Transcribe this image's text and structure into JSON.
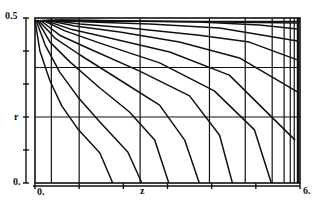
{
  "chart_data": {
    "type": "line",
    "title": "",
    "xlabel": "z",
    "ylabel": "r",
    "xlim": [
      0,
      6
    ],
    "ylim": [
      0,
      0.5
    ],
    "x_tick_labels": [
      "0.",
      "6."
    ],
    "y_tick_labels": [
      "0.",
      "0.5"
    ],
    "x_ticks": [
      0,
      1,
      2,
      3,
      4,
      5,
      6
    ],
    "y_ticks": [
      0,
      0.1,
      0.2,
      0.3,
      0.4,
      0.5
    ],
    "grid": true,
    "grid_z": [
      0.37,
      1.0,
      2.38,
      3.95,
      4.76,
      5.37,
      5.64,
      5.78,
      5.87
    ],
    "grid_r": [
      0.35,
      0.2,
      0.49
    ],
    "line_color": "#111111",
    "background": "#ffffff",
    "series": [
      {
        "name": "contour-1",
        "z": [
          0.0,
          0.11,
          0.34,
          0.61,
          0.97,
          1.47,
          1.76
        ],
        "r": [
          0.494,
          0.4,
          0.309,
          0.233,
          0.164,
          0.091,
          0.0
        ]
      },
      {
        "name": "contour-2",
        "z": [
          0.02,
          0.23,
          0.56,
          0.97,
          1.47,
          2.1,
          2.42
        ],
        "r": [
          0.494,
          0.418,
          0.336,
          0.261,
          0.185,
          0.094,
          0.0
        ]
      },
      {
        "name": "contour-3",
        "z": [
          0.05,
          0.34,
          0.79,
          1.47,
          2.14,
          2.71,
          3.03
        ],
        "r": [
          0.494,
          0.427,
          0.367,
          0.288,
          0.215,
          0.13,
          0.0
        ]
      },
      {
        "name": "contour-4",
        "z": [
          0.07,
          0.45,
          1.02,
          1.92,
          2.82,
          3.39,
          3.72
        ],
        "r": [
          0.494,
          0.439,
          0.388,
          0.312,
          0.236,
          0.13,
          0.0
        ]
      },
      {
        "name": "contour-5",
        "z": [
          0.11,
          0.56,
          1.24,
          2.37,
          3.5,
          4.18,
          4.47
        ],
        "r": [
          0.494,
          0.448,
          0.406,
          0.339,
          0.264,
          0.145,
          0.0
        ]
      },
      {
        "name": "contour-6",
        "z": [
          0.16,
          0.68,
          1.47,
          2.82,
          4.06,
          4.97,
          5.35
        ],
        "r": [
          0.494,
          0.461,
          0.424,
          0.364,
          0.279,
          0.161,
          0.0
        ]
      },
      {
        "name": "contour-7",
        "z": [
          0.2,
          0.79,
          1.69,
          3.05,
          4.4,
          5.89
        ],
        "r": [
          0.494,
          0.467,
          0.439,
          0.397,
          0.327,
          0.13
        ]
      },
      {
        "name": "contour-8",
        "z": [
          0.25,
          0.9,
          1.92,
          3.27,
          4.63,
          5.94
        ],
        "r": [
          0.494,
          0.476,
          0.458,
          0.427,
          0.379,
          0.276
        ]
      },
      {
        "name": "contour-9",
        "z": [
          0.29,
          1.02,
          2.14,
          3.72,
          4.85,
          5.94
        ],
        "r": [
          0.494,
          0.482,
          0.47,
          0.448,
          0.427,
          0.373
        ]
      },
      {
        "name": "contour-10",
        "z": [
          0.34,
          1.24,
          2.6,
          4.18,
          5.94
        ],
        "r": [
          0.494,
          0.488,
          0.482,
          0.47,
          0.43
        ]
      },
      {
        "name": "contour-11",
        "z": [
          0.45,
          1.92,
          3.72,
          5.08,
          5.94
        ],
        "r": [
          0.494,
          0.491,
          0.488,
          0.479,
          0.467
        ]
      },
      {
        "name": "contour-12",
        "z": [
          0.56,
          5.94
        ],
        "r": [
          0.494,
          0.485
        ]
      }
    ]
  },
  "labels": {
    "y_top": "0.5",
    "y_bottom": "0.",
    "y_axis": "r",
    "x_left": "0.",
    "x_axis": "z",
    "x_right": "6."
  }
}
